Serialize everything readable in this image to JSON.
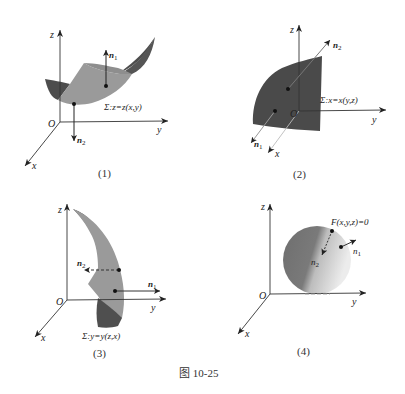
{
  "figure_caption": "图 10-25",
  "panels": [
    {
      "id": 1,
      "label": "(1)",
      "axes": {
        "x": "x",
        "y": "y",
        "z": "z",
        "origin": "O"
      },
      "surface_label": "Σ:z=z(x,y)",
      "normals": [
        {
          "name": "n",
          "sub": "1",
          "direction": "up"
        },
        {
          "name": "n",
          "sub": "2",
          "direction": "down"
        }
      ]
    },
    {
      "id": 2,
      "label": "(2)",
      "axes": {
        "x": "x",
        "y": "y",
        "z": "z",
        "origin": "O"
      },
      "surface_label": "Σ:x=x(y,z)",
      "normals": [
        {
          "name": "n",
          "sub": "1",
          "direction": "front"
        },
        {
          "name": "n",
          "sub": "2",
          "direction": "back"
        }
      ]
    },
    {
      "id": 3,
      "label": "(3)",
      "axes": {
        "x": "x",
        "y": "y",
        "z": "z",
        "origin": "O"
      },
      "surface_label": "Σ:y=y(z,x)",
      "normals": [
        {
          "name": "n",
          "sub": "1",
          "direction": "right"
        },
        {
          "name": "n",
          "sub": "2",
          "direction": "left"
        }
      ]
    },
    {
      "id": 4,
      "label": "(4)",
      "axes": {
        "x": "x",
        "y": "y",
        "z": "z",
        "origin": "O"
      },
      "surface_label": "F(x,y,z)=0",
      "normals": [
        {
          "name": "n",
          "sub": "1",
          "direction": "outward"
        },
        {
          "name": "n",
          "sub": "2",
          "direction": "inward"
        }
      ]
    }
  ],
  "colors": {
    "surface_dark": "#4a4a4a",
    "surface_mid": "#8c8c8c",
    "surface_light": "#a8a8a8",
    "axis": "#333333"
  }
}
